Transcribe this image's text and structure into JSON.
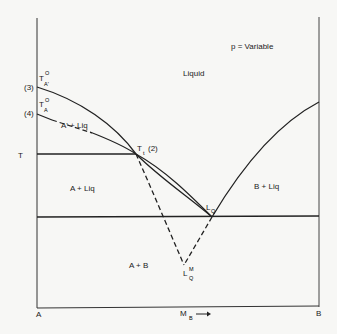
{
  "diagram": {
    "type": "binary phase diagram",
    "condition_label": "p = Variable",
    "axes": {
      "x_left_label": "A",
      "x_right_label": "B",
      "x_axis_label": "M",
      "x_axis_subscript": "B",
      "x_axis_arrow": "→",
      "y_label": "T"
    },
    "regions": {
      "liquid": "Liquid",
      "a_prime_liq": "A' + Liq",
      "a_liq": "A + Liq",
      "b_liq": "B + Liq",
      "a_b": "A + B"
    },
    "points": {
      "t_a_prime": {
        "main": "T",
        "sub": "A'",
        "sup": "O",
        "tag": "(3)"
      },
      "t_a": {
        "main": "T",
        "sub": "A",
        "sup": "O",
        "tag": "(4)"
      },
      "triple": {
        "main": "T",
        "sub": "t",
        "tag": "(2)"
      },
      "eutectic": {
        "main": "L",
        "sub": "Q"
      },
      "metastable": {
        "main": "L",
        "sub": "Q",
        "sup": "M"
      }
    },
    "colors": {
      "line": "#222222",
      "background": "#f7f7f5"
    }
  }
}
